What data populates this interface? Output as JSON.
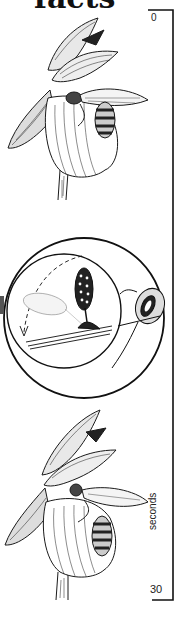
{
  "title": "facts",
  "timeline": {
    "start_label": "0",
    "end_label": "30",
    "unit_label": "seconds",
    "color": "#111111"
  },
  "panels": [
    {
      "name": "orchid-with-bee-entering",
      "description": "Lady's slipper orchid with bee on labellum"
    },
    {
      "name": "pollinia-detail-inset",
      "description": "Circular inset: pollinium stalk bending down onto bee's back, dashed arc arrow"
    },
    {
      "name": "orchid-with-bee-exiting",
      "description": "Lady's slipper orchid with bee emerging bearing pollinium"
    }
  ]
}
